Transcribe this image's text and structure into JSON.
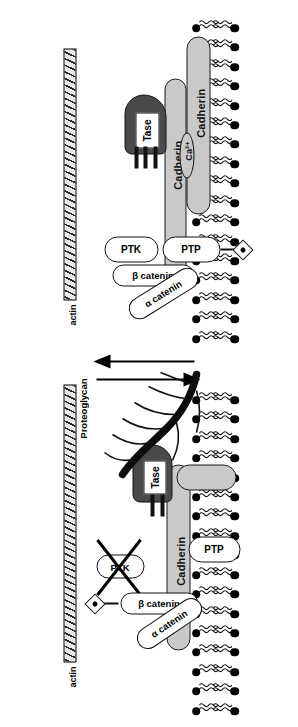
{
  "figure": {
    "type": "biological-schematic",
    "background_color": "#ffffff",
    "orientation_note": "figure rendered rotated 90 degrees"
  },
  "colors": {
    "line": "#111111",
    "cadherin_fill": "#c9c9c9",
    "enzyme_fill": "#4a4a4a",
    "actin_fill": "#e8e8e8",
    "actin_hatch": "#2a2a2a",
    "protein_fill": "#ffffff",
    "ink": "#000000"
  },
  "panels": [
    {
      "id": "adhesive-state",
      "name": "Adhesive / junction-assembled state",
      "membrane": {
        "leaflets": 2,
        "lipids_per_leaflet": 17
      },
      "cadherins": [
        {
          "label": "Cadherin",
          "position": "upper-opposing-cell"
        },
        {
          "label": "Cadherin",
          "position": "lower-membrane-anchored"
        }
      ],
      "ion": {
        "label": "Ca2+",
        "display": "Ca²⁺"
      },
      "enzyme": {
        "label": "Tase",
        "shape": "dark-wedge"
      },
      "proteins": [
        {
          "label": "PTP",
          "full": "protein tyrosine phosphatase",
          "state": "active"
        },
        {
          "label": "PTK",
          "full": "protein tyrosine kinase",
          "state": "active"
        },
        {
          "label": "β catenin",
          "state": "bound"
        },
        {
          "label": "α catenin",
          "state": "bound"
        }
      ],
      "phosphate": {
        "label": "P",
        "attached_to": "PTP"
      },
      "cytoskeleton": {
        "label": "actin",
        "style": "hatched-bar"
      }
    },
    {
      "id": "disassembled-state",
      "name": "Non-adhesive / junction-disassembled state",
      "membrane": {
        "leaflets": 2,
        "lipids_per_leaflet": 17
      },
      "cadherins": [
        {
          "label": "Cadherin",
          "position": "shed-extracellular-fragment"
        }
      ],
      "enzyme": {
        "label": "Tase",
        "shape": "dark-wedge"
      },
      "proteoglycan": {
        "label": "Proteoglycan",
        "style": "branched-dark-chain"
      },
      "proteins": [
        {
          "label": "PTP",
          "full": "protein tyrosine phosphatase",
          "state": "free"
        },
        {
          "label": "PTK",
          "full": "protein tyrosine kinase",
          "state": "crossed-out"
        },
        {
          "label": "β catenin",
          "state": "released"
        },
        {
          "label": "α catenin",
          "state": "released"
        }
      ],
      "phosphate": {
        "label": "P",
        "attached_to": "β catenin"
      },
      "cytoskeleton": {
        "label": "actin",
        "style": "hatched-bar"
      }
    }
  ],
  "arrows": [
    {
      "id": "forward",
      "direction": "down",
      "meaning": "assembly to disassembly"
    },
    {
      "id": "reverse",
      "direction": "up",
      "meaning": "disassembly to assembly"
    }
  ]
}
